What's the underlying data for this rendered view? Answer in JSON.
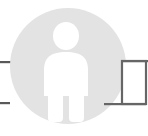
{
  "canvas": {
    "width": 148,
    "height": 136,
    "background_color": "#ffffff"
  },
  "diagram": {
    "title": "",
    "node": {
      "type": "user-avatar",
      "shape": "circle",
      "icon": "person-icon",
      "circle_fill": "#e3e3e3",
      "icon_fill": "#ffffff",
      "center_x": 68,
      "center_y": 66,
      "radius": 58,
      "label": ""
    },
    "box": {
      "type": "rectangle-node",
      "label": "",
      "fill": "#ffffff",
      "stroke": "#666666",
      "x": 121,
      "y": 60,
      "width": 25,
      "height": 45
    },
    "connectors": [
      {
        "name": "left-upper-connector",
        "orientation": "horizontal",
        "color": "#595959",
        "x1": 0,
        "y1": 62,
        "x2": 12,
        "y2": 62
      },
      {
        "name": "left-lower-connector",
        "orientation": "horizontal",
        "color": "#595959",
        "x1": 0,
        "y1": 103,
        "x2": 10,
        "y2": 103
      },
      {
        "name": "box-top-connector",
        "orientation": "horizontal",
        "color": "#666666",
        "x1": 121,
        "y1": 61,
        "x2": 148,
        "y2": 61
      },
      {
        "name": "box-bottom-connector",
        "orientation": "horizontal",
        "color": "#666666",
        "x1": 104,
        "y1": 104,
        "x2": 146,
        "y2": 104
      }
    ]
  }
}
